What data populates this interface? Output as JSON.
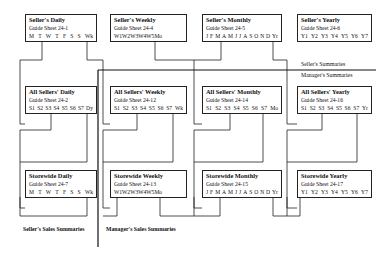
{
  "diagram": {
    "section_labels": {
      "sellers_summaries": "Seller's Summaries",
      "managers_summaries": "Manager's Summaries",
      "sellers_sales_summaries": "Seller's Sales Summaries",
      "managers_sales_summaries": "Manager's Sales Summaries"
    },
    "boxes": [
      {
        "id": "sellers-daily",
        "title": "Seller's Daily",
        "sheet": "Guide Sheet 24-1",
        "columns": [
          "M",
          "T",
          "W",
          "T",
          "F",
          "S",
          "S",
          "Wk"
        ]
      },
      {
        "id": "sellers-weekly",
        "title": "Seller's Weekly",
        "sheet": "Guide Sheet 24-4",
        "columns": [
          "W1",
          "W2",
          "W3",
          "W4",
          "W5",
          "Mo"
        ]
      },
      {
        "id": "sellers-monthly",
        "title": "Seller's Monthly",
        "sheet": "Guide Sheet 24-5",
        "columns": [
          "J",
          "F",
          "M",
          "A",
          "M",
          "J",
          "J",
          "A",
          "S",
          "O",
          "N",
          "D",
          "Yr"
        ]
      },
      {
        "id": "sellers-yearly",
        "title": "Seller's Yearly",
        "sheet": "Guide Sheet 24-6",
        "columns": [
          "Y1",
          "Y2",
          "Y3",
          "Y4",
          "Y5",
          "Y6",
          "Y7"
        ]
      },
      {
        "id": "all-sellers-daily",
        "title": "All Sellers' Daily",
        "sheet": "Guide Sheet 24-2",
        "columns": [
          "S1",
          "S2",
          "S3",
          "S4",
          "S5",
          "S6",
          "S7",
          "Dy"
        ]
      },
      {
        "id": "all-sellers-weekly",
        "title": "All Sellers' Weekly",
        "sheet": "Guide Sheet 24-12",
        "columns": [
          "S1",
          "S2",
          "S3",
          "S4",
          "S5",
          "S6",
          "S7",
          "Wk"
        ]
      },
      {
        "id": "all-sellers-monthly",
        "title": "All Sellers' Monthly",
        "sheet": "Guide Sheet 24-14",
        "columns": [
          "S1",
          "S2",
          "S3",
          "S4",
          "S5",
          "S6",
          "S7",
          "Mo"
        ]
      },
      {
        "id": "all-sellers-yearly",
        "title": "All Sellers' Yearly",
        "sheet": "Guide Sheet 24-16",
        "columns": [
          "S1",
          "S2",
          "S3",
          "S4",
          "S5",
          "S6",
          "S7",
          "Yr"
        ]
      },
      {
        "id": "storewide-daily",
        "title": "Storewide Daily",
        "sheet": "Guide Sheet 24-7",
        "columns": [
          "M",
          "T",
          "W",
          "T",
          "F",
          "S",
          "S",
          "Wk"
        ]
      },
      {
        "id": "storewide-weekly",
        "title": "Storewide Weekly",
        "sheet": "Guide Sheet 24-13",
        "columns": [
          "W1",
          "W2",
          "W3",
          "W4",
          "W5",
          "Mo"
        ]
      },
      {
        "id": "storewide-monthly",
        "title": "Storewide Monthly",
        "sheet": "Guide Sheet 24-15",
        "columns": [
          "J",
          "F",
          "M",
          "A",
          "M",
          "J",
          "J",
          "A",
          "S",
          "O",
          "N",
          "D",
          "Yr"
        ]
      },
      {
        "id": "storewide-yearly",
        "title": "Storewide Yearly",
        "sheet": "Guide Sheet 24-17",
        "columns": [
          "Y1",
          "Y2",
          "Y3",
          "Y4",
          "Y5",
          "Y6",
          "Y7"
        ]
      }
    ]
  }
}
